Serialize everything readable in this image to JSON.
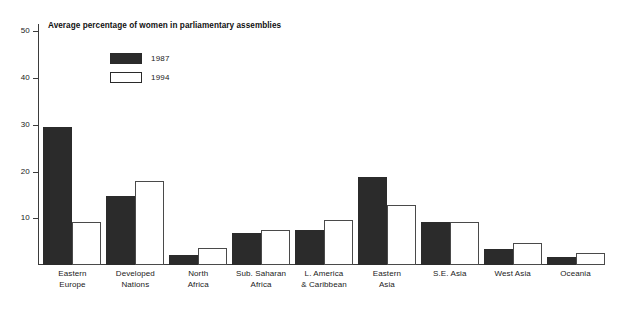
{
  "chart_data": {
    "type": "bar",
    "title": "Average percentage of women in parliamentary assemblies",
    "xlabel": "",
    "ylabel": "",
    "ylim": [
      0,
      52
    ],
    "yticks": [
      10,
      20,
      30,
      40,
      50
    ],
    "grid": false,
    "legend_position": "inside-top-left",
    "categories": [
      "Eastern Europe",
      "Developed Nations",
      "North Africa",
      "Sub. Saharan Africa",
      "L. America & Caribbean",
      "Eastern Asia",
      "S.E. Asia",
      "West Asia",
      "Oceania"
    ],
    "category_lines": [
      [
        "Eastern",
        "Europe"
      ],
      [
        "Developed",
        "Nations"
      ],
      [
        "North",
        "Africa"
      ],
      [
        "Sub. Saharan",
        "Africa"
      ],
      [
        "L. America",
        "& Caribbean"
      ],
      [
        "Eastern",
        "Asia"
      ],
      [
        "S.E. Asia",
        ""
      ],
      [
        "West Asia",
        ""
      ],
      [
        "Oceania",
        ""
      ]
    ],
    "series": [
      {
        "name": "1987",
        "color": "#2b2b2b",
        "values": [
          29.5,
          14.7,
          2.2,
          6.8,
          7.4,
          18.8,
          9.2,
          3.5,
          1.7
        ]
      },
      {
        "name": "1994",
        "color": "#ffffff",
        "values": [
          9.3,
          18.0,
          3.6,
          7.5,
          9.6,
          12.9,
          9.1,
          4.8,
          2.5
        ]
      }
    ]
  }
}
